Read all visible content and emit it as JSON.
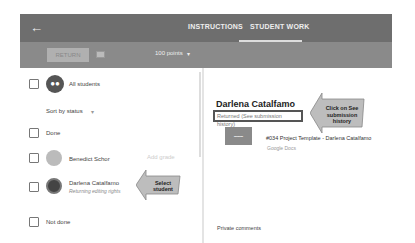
{
  "header": {
    "back_icon": "arrow-left-icon",
    "tabs": [
      {
        "label": "INSTRUCTIONS",
        "active": false
      },
      {
        "label": "STUDENT WORK",
        "active": true
      }
    ]
  },
  "toolbar": {
    "return_label": "RETURN",
    "mail_icon": "mail-icon",
    "points_label": "100 points",
    "points_caret": "▾"
  },
  "sidebar": {
    "all_students_label": "All students",
    "sort_label": "Sort by status",
    "sort_caret": "▾",
    "groups": [
      {
        "label": "Done"
      },
      {
        "label": "Not done"
      }
    ],
    "students": [
      {
        "name": "Benedict Schor",
        "grade_placeholder": "Add grade",
        "status": ""
      },
      {
        "name": "Darlena Catalfamo",
        "status": "Returning editing rights"
      }
    ]
  },
  "annotations": {
    "select_student": "Select student",
    "see_history": "Click on See submission history"
  },
  "detail": {
    "student_name": "Darlena Catalfamo",
    "status_text": "Returned (See submission history)",
    "attachment_title": "#034 Project Template - Darlena Catalfamo",
    "attachment_type": "Google Docs",
    "private_comments_label": "Private comments"
  },
  "colors": {
    "topbar": "#6e6e6e",
    "subbar": "#8a8a8a",
    "callout": "#bdbdbd"
  }
}
